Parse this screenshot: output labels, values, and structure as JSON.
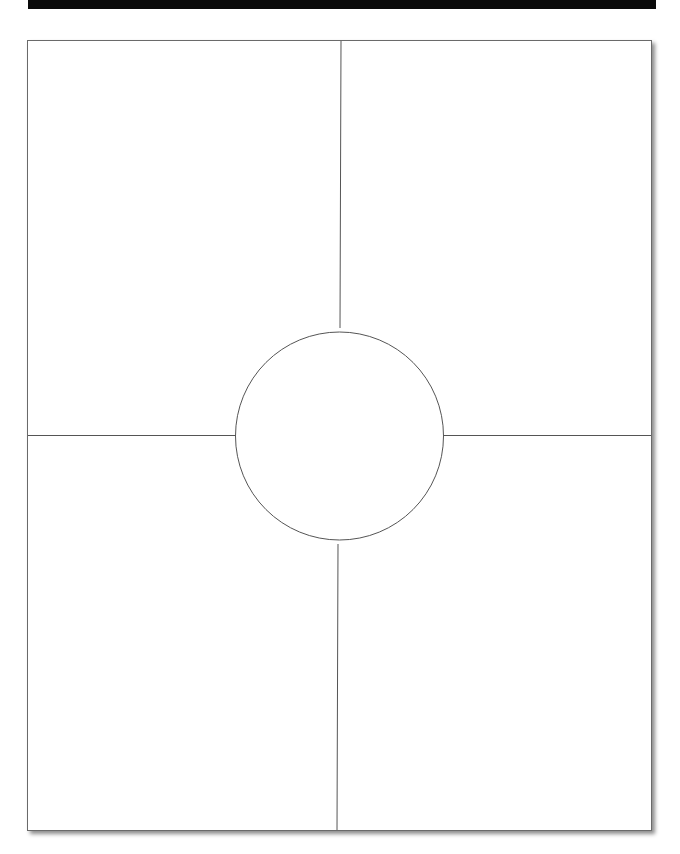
{
  "header": {
    "banner_text": ""
  },
  "worksheet": {
    "layout": "four-quadrant organizer with center circle",
    "quadrants": [
      {
        "position": "top-left",
        "content": ""
      },
      {
        "position": "top-right",
        "content": ""
      },
      {
        "position": "bottom-left",
        "content": ""
      },
      {
        "position": "bottom-right",
        "content": ""
      }
    ],
    "center_circle": {
      "content": ""
    },
    "colors": {
      "line": "#555555",
      "border": "#6a6a6a",
      "banner": "#0a0a0a",
      "background": "#ffffff"
    }
  }
}
